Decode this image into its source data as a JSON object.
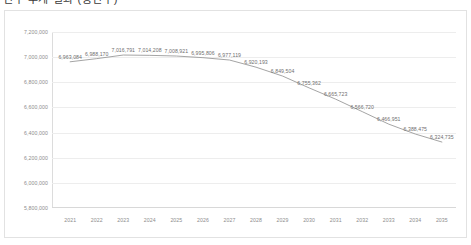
{
  "header": {
    "title": "인구 추계 결과 (총인구)",
    "title_note": "cropped-top-title"
  },
  "panel": {
    "border_color": "#e2e2e2",
    "background": "#ffffff"
  },
  "chart_data": {
    "type": "line",
    "title": "",
    "xlabel": "",
    "ylabel": "",
    "grid": true,
    "legend": false,
    "legend_position": "none",
    "line_color": "#9a9a9a",
    "label_color": "#6f6f6f",
    "tick_color": "#8d8d8d",
    "gridline_color": "#ededed",
    "ylim": [
      5800000,
      7200000
    ],
    "ytick_step": 200000,
    "ytick_labels": [
      "7,200,000",
      "7,000,000",
      "6,800,000",
      "6,600,000",
      "6,400,000",
      "6,200,000",
      "6,000,000",
      "5,800,000"
    ],
    "ytick_values": [
      7200000,
      7000000,
      6800000,
      6600000,
      6400000,
      6200000,
      6000000,
      5800000
    ],
    "categories": [
      "2021",
      "2022",
      "2023",
      "2024",
      "2025",
      "2026",
      "2027",
      "2028",
      "2029",
      "2030",
      "2031",
      "2032",
      "2033",
      "2034",
      "2035"
    ],
    "values": [
      6963084,
      6988170,
      7016791,
      7014208,
      7008921,
      6995806,
      6977119,
      6920193,
      6849504,
      6755362,
      6665723,
      6566720,
      6466951,
      6388475,
      6324735
    ],
    "value_labels": [
      "6,963,084",
      "6,988,170",
      "7,016,791",
      "7,014,208",
      "7,008,921",
      "6,995,806",
      "6,977,119",
      "6,920,193",
      "6,849,504",
      "6,755,362",
      "6,665,723",
      "6,566,720",
      "6,466,951",
      "6,388,475",
      "6,324,735"
    ],
    "peak": {
      "category": "2023",
      "value": 7016791
    },
    "min": {
      "category": "2035",
      "value": 6324735
    }
  }
}
